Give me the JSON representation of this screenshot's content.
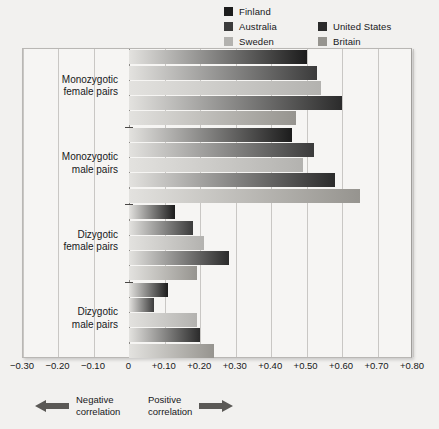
{
  "legend": {
    "col1": [
      {
        "label": "Finland",
        "color": "#1c1c1c",
        "swatch_name": "legend-swatch-finland"
      },
      {
        "label": "Australia",
        "color": "#3b3b3b",
        "swatch_name": "legend-swatch-australia"
      },
      {
        "label": "Sweden",
        "color": "#b3b2af",
        "swatch_name": "legend-swatch-sweden"
      }
    ],
    "col2": [
      {
        "label": "United States",
        "color": "#2b2b2b",
        "swatch_name": "legend-swatch-united-states"
      },
      {
        "label": "Britain",
        "color": "#96948f",
        "swatch_name": "legend-swatch-britain"
      }
    ]
  },
  "axis": {
    "ticks": [
      "−0.30",
      "−0.20",
      "−0.10",
      "0",
      "+0.10",
      "+0.20",
      "+0.30",
      "+0.40",
      "+0.50",
      "+0.60",
      "+0.70",
      "+0.80"
    ],
    "tick_values": [
      -0.3,
      -0.2,
      -0.1,
      0.0,
      0.1,
      0.2,
      0.3,
      0.4,
      0.5,
      0.6,
      0.7,
      0.8
    ],
    "xmin": -0.3,
    "xmax": 0.8
  },
  "annotations": {
    "negative": {
      "line1": "Negative",
      "line2": "correlation"
    },
    "positive": {
      "line1": "Positive",
      "line2": "correlation"
    }
  },
  "categories": [
    {
      "line1": "Monozygotic",
      "line2": "female pairs"
    },
    {
      "line1": "Monozygotic",
      "line2": "male pairs"
    },
    {
      "line1": "Dizygotic",
      "line2": "female pairs"
    },
    {
      "line1": "Dizygotic",
      "line2": "male pairs"
    }
  ],
  "chart_data": {
    "type": "bar",
    "orientation": "horizontal",
    "title": "",
    "xlabel": "",
    "ylabel": "",
    "xlim": [
      -0.3,
      0.8
    ],
    "grid": true,
    "legend_position": "top-right",
    "categories": [
      "Monozygotic female pairs",
      "Monozygotic male pairs",
      "Dizygotic female pairs",
      "Dizygotic male pairs"
    ],
    "series": [
      {
        "name": "Finland",
        "color": "#1c1c1c",
        "values": [
          0.5,
          0.46,
          0.13,
          0.11
        ]
      },
      {
        "name": "Australia",
        "color": "#3b3b3b",
        "values": [
          0.53,
          0.52,
          0.18,
          0.07
        ]
      },
      {
        "name": "Sweden",
        "color": "#b3b2af",
        "values": [
          0.54,
          0.49,
          0.21,
          0.19
        ]
      },
      {
        "name": "United States",
        "color": "#2b2b2b",
        "values": [
          0.6,
          0.58,
          0.28,
          0.2
        ]
      },
      {
        "name": "Britain",
        "color": "#96948f",
        "values": [
          0.47,
          0.65,
          0.19,
          0.24
        ]
      }
    ]
  }
}
